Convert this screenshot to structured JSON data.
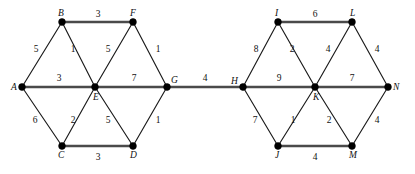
{
  "figure": {
    "name": "weighted-graph-two-hexagons",
    "background_color": "#ffffff",
    "node_color": "#000000",
    "edge_color": "#1a1a1a",
    "horizontal_edge_color": "#4a4a4a",
    "width": 415,
    "height": 174
  },
  "chart_data": {
    "type": "diagram",
    "title": "",
    "graph_kind": "undirected weighted graph",
    "nodes": [
      {
        "id": "A",
        "label": "A",
        "x": 22,
        "y": 87,
        "label_dx": -11,
        "label_dy": 3
      },
      {
        "id": "B",
        "label": "B",
        "x": 62,
        "y": 22,
        "label_dx": -4,
        "label_dy": -6
      },
      {
        "id": "C",
        "label": "C",
        "x": 62,
        "y": 146,
        "label_dx": -4,
        "label_dy": 12
      },
      {
        "id": "D",
        "label": "D",
        "x": 133,
        "y": 146,
        "label_dx": -3,
        "label_dy": 12
      },
      {
        "id": "E",
        "label": "E",
        "x": 95,
        "y": 87,
        "label_dx": -2,
        "label_dy": 13
      },
      {
        "id": "F",
        "label": "F",
        "x": 133,
        "y": 22,
        "label_dx": -3,
        "label_dy": -6
      },
      {
        "id": "G",
        "label": "G",
        "x": 167,
        "y": 87,
        "label_dx": 4,
        "label_dy": -4
      },
      {
        "id": "H",
        "label": "H",
        "x": 243,
        "y": 87,
        "label_dx": -12,
        "label_dy": -3
      },
      {
        "id": "I",
        "label": "I",
        "x": 278,
        "y": 22,
        "label_dx": -3,
        "label_dy": -6
      },
      {
        "id": "J",
        "label": "J",
        "x": 278,
        "y": 146,
        "label_dx": -3,
        "label_dy": 12
      },
      {
        "id": "K",
        "label": "K",
        "x": 315,
        "y": 87,
        "label_dx": -2,
        "label_dy": 13
      },
      {
        "id": "L",
        "label": "L",
        "x": 352,
        "y": 22,
        "label_dx": -2,
        "label_dy": -6
      },
      {
        "id": "M",
        "label": "M",
        "x": 352,
        "y": 146,
        "label_dx": -3,
        "label_dy": 12
      },
      {
        "id": "N",
        "label": "N",
        "x": 388,
        "y": 87,
        "label_dx": 5,
        "label_dy": 3
      }
    ],
    "edges": [
      {
        "from": "A",
        "to": "B",
        "weight": 5,
        "style": "thin",
        "label_x": 36,
        "label_y": 52
      },
      {
        "from": "B",
        "to": "F",
        "weight": 3,
        "style": "thick",
        "label_x": 98,
        "label_y": 17
      },
      {
        "from": "B",
        "to": "E",
        "weight": 1,
        "style": "thin",
        "label_x": 73,
        "label_y": 52
      },
      {
        "from": "A",
        "to": "E",
        "weight": 3,
        "style": "thick",
        "label_x": 59,
        "label_y": 81
      },
      {
        "from": "E",
        "to": "F",
        "weight": 5,
        "style": "thin",
        "label_x": 108,
        "label_y": 52
      },
      {
        "from": "F",
        "to": "G",
        "weight": 1,
        "style": "thin",
        "label_x": 158,
        "label_y": 52
      },
      {
        "from": "E",
        "to": "G",
        "weight": 7,
        "style": "thick",
        "label_x": 134,
        "label_y": 81
      },
      {
        "from": "A",
        "to": "C",
        "weight": 6,
        "style": "thin",
        "label_x": 35,
        "label_y": 123
      },
      {
        "from": "C",
        "to": "E",
        "weight": 2,
        "style": "thin",
        "label_x": 73,
        "label_y": 123
      },
      {
        "from": "E",
        "to": "D",
        "weight": 5,
        "style": "thin",
        "label_x": 108,
        "label_y": 123
      },
      {
        "from": "D",
        "to": "G",
        "weight": 1,
        "style": "thin",
        "label_x": 158,
        "label_y": 123
      },
      {
        "from": "C",
        "to": "D",
        "weight": 3,
        "style": "thick",
        "label_x": 98,
        "label_y": 160
      },
      {
        "from": "G",
        "to": "H",
        "weight": 4,
        "style": "thick",
        "label_x": 205,
        "label_y": 81
      },
      {
        "from": "H",
        "to": "I",
        "weight": 8,
        "style": "thin",
        "label_x": 256,
        "label_y": 52
      },
      {
        "from": "I",
        "to": "L",
        "weight": 6,
        "style": "thick",
        "label_x": 315,
        "label_y": 17
      },
      {
        "from": "I",
        "to": "K",
        "weight": 2,
        "style": "thin",
        "label_x": 292,
        "label_y": 52
      },
      {
        "from": "H",
        "to": "K",
        "weight": 9,
        "style": "thick",
        "label_x": 279,
        "label_y": 81
      },
      {
        "from": "K",
        "to": "L",
        "weight": 4,
        "style": "thin",
        "label_x": 328,
        "label_y": 52
      },
      {
        "from": "L",
        "to": "N",
        "weight": 4,
        "style": "thin",
        "label_x": 377,
        "label_y": 52
      },
      {
        "from": "K",
        "to": "N",
        "weight": 7,
        "style": "thick",
        "label_x": 352,
        "label_y": 81
      },
      {
        "from": "H",
        "to": "J",
        "weight": 7,
        "style": "thin",
        "label_x": 255,
        "label_y": 123
      },
      {
        "from": "J",
        "to": "K",
        "weight": 1,
        "style": "thin",
        "label_x": 293,
        "label_y": 123
      },
      {
        "from": "K",
        "to": "M",
        "weight": 2,
        "style": "thin",
        "label_x": 329,
        "label_y": 123
      },
      {
        "from": "M",
        "to": "N",
        "weight": 4,
        "style": "thin",
        "label_x": 377,
        "label_y": 123
      },
      {
        "from": "J",
        "to": "M",
        "weight": 4,
        "style": "thick",
        "label_x": 315,
        "label_y": 160
      }
    ]
  }
}
